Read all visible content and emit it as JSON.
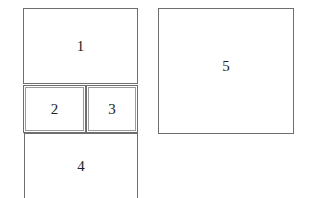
{
  "diagram": {
    "type": "panel-layout",
    "panels": [
      {
        "id": "1",
        "label": "1"
      },
      {
        "id": "2",
        "label": "2"
      },
      {
        "id": "3",
        "label": "3"
      },
      {
        "id": "4",
        "label": "4"
      },
      {
        "id": "5",
        "label": "5"
      }
    ]
  }
}
